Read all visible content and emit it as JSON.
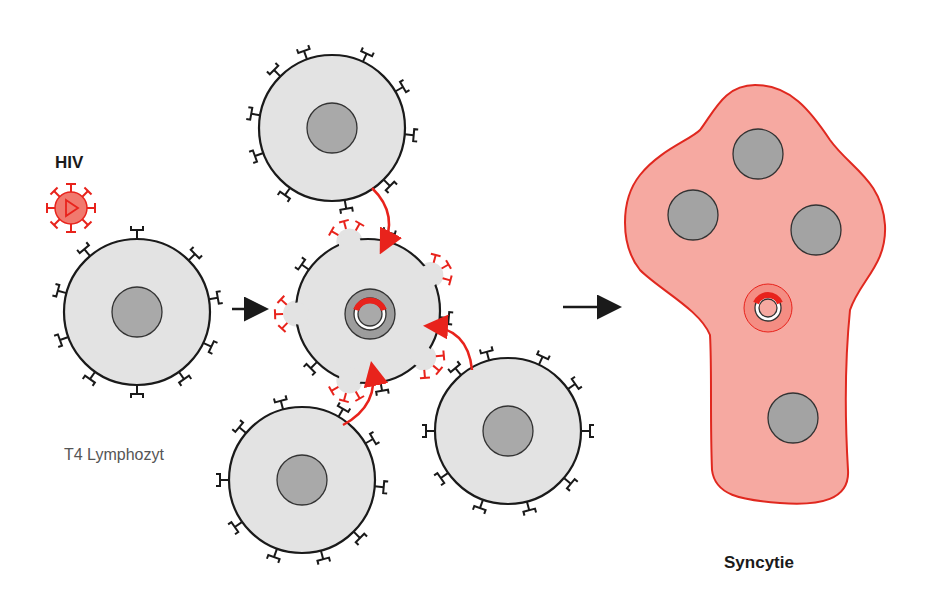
{
  "labels": {
    "hiv": "HIV",
    "t4": "T4 Lymphozyt",
    "syncytium": "Syncytie"
  },
  "colors": {
    "cell_fill": "#e3e3e3",
    "cell_stroke": "#1a1a1a",
    "nucleus_fill": "#a9a9a9",
    "virus_red": "#e8231c",
    "virus_fill": "#f1796e",
    "syncytium_fill": "#f6a9a1",
    "syncytium_stroke": "#e0281f"
  },
  "cells": [
    {
      "id": "t4-lymphocyte",
      "cx": 137,
      "cy": 312,
      "r": 73
    },
    {
      "id": "cell-top",
      "cx": 332,
      "cy": 128,
      "r": 73
    },
    {
      "id": "cell-bottom-left",
      "cx": 302,
      "cy": 480,
      "r": 73
    },
    {
      "id": "cell-bottom-right",
      "cx": 508,
      "cy": 431,
      "r": 73
    },
    {
      "id": "infected-center",
      "cx": 368,
      "cy": 311,
      "r": 72
    }
  ],
  "syncytium_nuclei": [
    {
      "cx": 758,
      "cy": 154
    },
    {
      "cx": 693,
      "cy": 215
    },
    {
      "cx": 816,
      "cy": 230
    },
    {
      "cx": 793,
      "cy": 418
    }
  ]
}
